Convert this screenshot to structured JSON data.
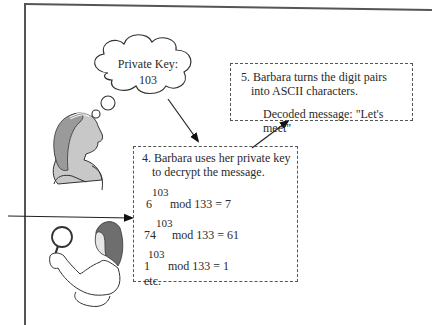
{
  "cloud": {
    "line1": "Private Key:",
    "line2": "103"
  },
  "step5": {
    "line1": "5. Barbara turns the digit pairs",
    "line2": "into ASCII characters.",
    "decoded": "Decoded message: \"Let's meet\""
  },
  "step4": {
    "line1": "4. Barbara uses her private key",
    "line2": "to decrypt the message.",
    "equations": [
      {
        "base": "6",
        "exponent": "103",
        "rest": "mod 133 = 7"
      },
      {
        "base": "74",
        "exponent": "103",
        "rest": "mod 133 = 61"
      },
      {
        "base": "1",
        "exponent": "103",
        "rest": "mod 133 = 1"
      }
    ],
    "etc": "etc."
  },
  "figures": {
    "barbara_icon": "woman-thinking-icon",
    "eavesdropper_icon": "woman-magnifying-glass-icon"
  },
  "colors": {
    "line": "#333333",
    "skin_shade": "#c8c8c8",
    "hair": "#777777"
  }
}
